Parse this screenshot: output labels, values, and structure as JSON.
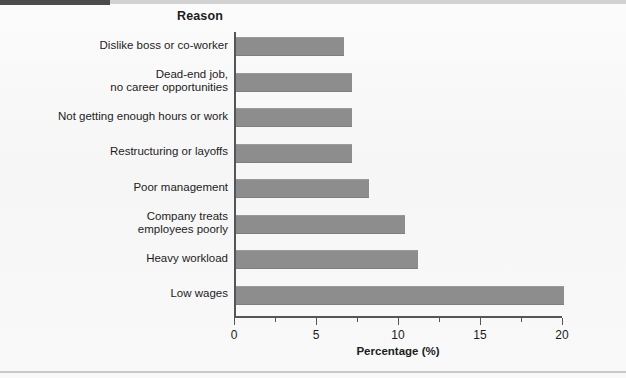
{
  "chart_data": {
    "type": "bar",
    "orientation": "horizontal",
    "title": "Reason",
    "xlabel": "Percentage (%)",
    "ylabel": "Reason",
    "xlim": [
      0,
      20
    ],
    "xticks": [
      0,
      5,
      10,
      15,
      20
    ],
    "xtick_labels": [
      "0",
      "5",
      "10",
      "15",
      "20"
    ],
    "xminor_ticks": [
      2.5,
      7.5,
      12.5,
      17.5
    ],
    "grid": false,
    "legend": null,
    "bar_color": "#8d8d8d",
    "categories": [
      "Dislike boss or co-worker",
      "Dead-end job,\nno career opportunities",
      "Not getting enough hours or work",
      "Restructuring or layoffs",
      "Poor management",
      "Company treats\nemployees poorly",
      "Heavy workload",
      "Low wages"
    ],
    "values": [
      6.6,
      7.1,
      7.1,
      7.1,
      8.1,
      10.3,
      11.1,
      20.0
    ]
  }
}
